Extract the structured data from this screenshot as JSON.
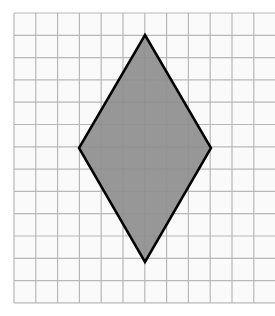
{
  "figure": {
    "grid": {
      "origin_px": [
        14,
        13
      ],
      "cell_w_px": 21.8,
      "cell_h_px": 22.3,
      "columns": 12,
      "rows": 13,
      "line_color": "#b8b8b8",
      "background": "#fafafa"
    },
    "shape": {
      "type": "rhombus",
      "fill": "#8e8e8e",
      "stroke": "#000000",
      "stroke_width": 2.5,
      "vertices_px": [
        [
          145,
          35
        ],
        [
          211,
          148
        ],
        [
          145,
          262
        ],
        [
          79,
          148
        ]
      ],
      "vertices_grid": [
        [
          6,
          1
        ],
        [
          9,
          6
        ],
        [
          6,
          11
        ],
        [
          3,
          6
        ]
      ],
      "width_units": 6,
      "height_units": 10
    }
  }
}
